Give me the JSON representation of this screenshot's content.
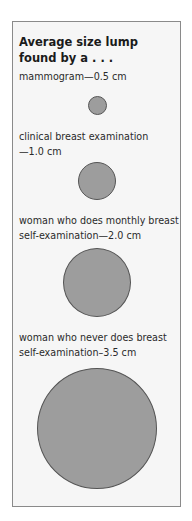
{
  "title_lines": [
    "Average size lump",
    "found by a . . ."
  ],
  "items": [
    {
      "label_lines": [
        "mammogram—0.5 cm"
      ],
      "size_cm": 0.5
    },
    {
      "label_lines": [
        "clinical breast examination",
        "—1.0 cm"
      ],
      "size_cm": 1.0
    },
    {
      "label_lines": [
        "woman who does monthly breast",
        "self-examination—2.0 cm"
      ],
      "size_cm": 2.0
    },
    {
      "label_lines": [
        "woman who never does breast",
        "self-examination–3.5 cm"
      ],
      "size_cm": 3.5
    }
  ],
  "colors": {
    "circle_fill": "#9d9d9d",
    "circle_stroke": "#555555",
    "panel_bg": "#f6f6f6",
    "border": "#8a8a8a"
  }
}
